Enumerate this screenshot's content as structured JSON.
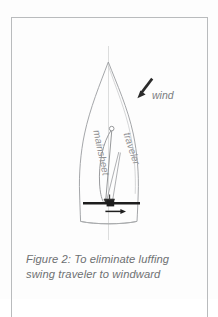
{
  "figure": {
    "caption": "Figure 2: To eliminate luffing swing traveler to windward",
    "caption_line_1": "Figure 2: To eliminate luffing",
    "caption_line_2": "swing traveler to windward",
    "labels": {
      "wind": "wind",
      "mainsheet": "mainsheet",
      "traveler": "traveler"
    },
    "colors": {
      "background": "#fdfdfd",
      "frame_border": "#b9bbbd",
      "hull_outline": "#9a9c9f",
      "centerline": "#d8d9da",
      "rigging_line": "#8a8c8f",
      "traveler_track": "#1d1d1d",
      "wind_arrow": "#2b2b2b",
      "caption_text": "#6e7072",
      "label_text": "#85878a"
    },
    "diagram_elements": [
      "boat-hull-top-view",
      "hull-centerline",
      "mast",
      "sail",
      "boom",
      "mainsheet-lines",
      "traveler-track",
      "traveler-car",
      "traveler-direction-arrow",
      "wind-arrow"
    ]
  }
}
